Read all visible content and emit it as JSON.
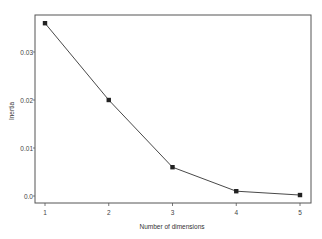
{
  "chart_data": {
    "type": "line",
    "title": "",
    "xlabel": "Number of dimensions",
    "ylabel": "Inertia",
    "x": [
      1,
      2,
      3,
      4,
      5
    ],
    "series": [
      {
        "name": "Inertia",
        "values": [
          0.036,
          0.02,
          0.006,
          0.001,
          0.0002
        ],
        "marker": "square",
        "color": "#222222"
      }
    ],
    "x_ticks": [
      "1",
      "2",
      "3",
      "4",
      "5"
    ],
    "y_ticks": [
      "0.0",
      "0.01",
      "0.02",
      "0.03"
    ],
    "y_tick_values": [
      0.0,
      0.01,
      0.02,
      0.03
    ],
    "xlim": [
      0.83,
      5.17
    ],
    "ylim": [
      -0.0015,
      0.0376
    ],
    "grid": false,
    "legend": "none"
  }
}
